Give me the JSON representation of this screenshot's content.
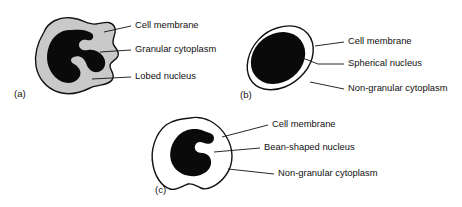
{
  "figure": {
    "background_color": "#ffffff",
    "stroke_color": "#111111",
    "nucleus_color": "#0a0a0a",
    "granular_cytoplasm_color": "#c9c9c9",
    "non_granular_cytoplasm_color": "#ffffff"
  },
  "panels": [
    {
      "id": "a",
      "letter": "(a)",
      "letter_x": 14,
      "letter_y": 94,
      "cytoplasm_fill": "#c9c9c9",
      "labels": [
        {
          "key": "cell-membrane",
          "text": "Cell membrane",
          "text_x": 135,
          "text_y": 26,
          "leader": "M 104 32 L 131 26"
        },
        {
          "key": "granular-cytoplasm",
          "text": "Granular cytoplasm",
          "text_x": 135,
          "text_y": 50,
          "leader": "M 100 52 L 131 50"
        },
        {
          "key": "lobed-nucleus",
          "text": "Lobed nucleus",
          "text_x": 135,
          "text_y": 77,
          "leader": "M 92 79 L 131 77"
        }
      ]
    },
    {
      "id": "b",
      "letter": "(b)",
      "letter_x": 240,
      "letter_y": 95,
      "cytoplasm_fill": "#ffffff",
      "labels": [
        {
          "key": "cell-membrane",
          "text": "Cell membrane",
          "text_x": 348,
          "text_y": 42,
          "leader": "M 315 46 L 344 42"
        },
        {
          "key": "spherical-nucleus",
          "text": "Spherical nucleus",
          "text_x": 348,
          "text_y": 64,
          "leader": "M 300 57 L 318 64 L 344 64"
        },
        {
          "key": "non-granular-cytoplasm",
          "text": "Non-granular cytoplasm",
          "text_x": 348,
          "text_y": 89,
          "leader": "M 310 82 L 344 89"
        }
      ]
    },
    {
      "id": "c",
      "letter": "(c)",
      "letter_x": 155,
      "letter_y": 190,
      "cytoplasm_fill": "#ffffff",
      "labels": [
        {
          "key": "cell-membrane",
          "text": "Cell membrane",
          "text_x": 272,
          "text_y": 125,
          "leader": "M 222 137 L 268 125"
        },
        {
          "key": "bean-shaped-nucleus",
          "text": "Bean-shaped nucleus",
          "text_x": 264,
          "text_y": 148,
          "leader": "M 214 152 L 260 148"
        },
        {
          "key": "non-granular-cytoplasm",
          "text": "Non-granular cytoplasm",
          "text_x": 278,
          "text_y": 174,
          "leader": "M 228 169 L 274 174"
        }
      ]
    }
  ]
}
